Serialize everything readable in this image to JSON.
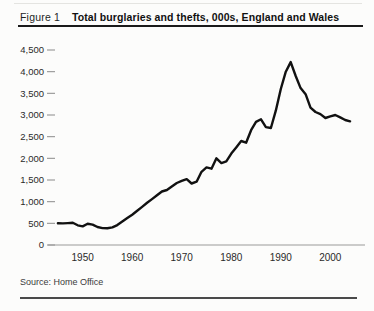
{
  "header": {
    "figure_label": "Figure 1",
    "title": "Total burglaries and thefts, 000s, England and Wales"
  },
  "footer": {
    "source": "Source: Home Office"
  },
  "chart_data": {
    "type": "line",
    "title": "Total burglaries and thefts, 000s, England and Wales",
    "series_name": "Total burglaries and thefts (000s)",
    "xlabel": "",
    "ylabel": "",
    "xlim": [
      1943,
      2007
    ],
    "ylim": [
      0,
      4500
    ],
    "grid": false,
    "legend": "none",
    "x_ticks": [
      1950,
      1960,
      1970,
      1980,
      1990,
      2000
    ],
    "y_ticks": [
      0,
      500,
      1000,
      1500,
      2000,
      2500,
      3000,
      3500,
      4000,
      4500
    ],
    "y_tick_labels": [
      "0",
      "500",
      "1,000",
      "1,500",
      "2,000",
      "2,500",
      "3,000",
      "3,500",
      "4,000",
      "4,500"
    ],
    "line_color": "#111111",
    "axis_color": "#9a9a9a",
    "tick_color": "#8a8a8a",
    "label_color": "#2a2a2a",
    "x": [
      1945,
      1946,
      1947,
      1948,
      1949,
      1950,
      1951,
      1952,
      1953,
      1954,
      1955,
      1956,
      1957,
      1958,
      1959,
      1960,
      1961,
      1962,
      1963,
      1964,
      1965,
      1966,
      1967,
      1968,
      1969,
      1970,
      1971,
      1972,
      1973,
      1974,
      1975,
      1976,
      1977,
      1978,
      1979,
      1980,
      1981,
      1982,
      1983,
      1984,
      1985,
      1986,
      1987,
      1988,
      1989,
      1990,
      1991,
      1992,
      1993,
      1994,
      1995,
      1996,
      1997,
      1998,
      1999,
      2000,
      2001,
      2002,
      2003,
      2004
    ],
    "values": [
      500,
      498,
      505,
      515,
      455,
      430,
      490,
      470,
      415,
      390,
      385,
      405,
      460,
      540,
      620,
      700,
      790,
      880,
      975,
      1060,
      1150,
      1235,
      1270,
      1350,
      1430,
      1480,
      1520,
      1420,
      1460,
      1690,
      1790,
      1760,
      2000,
      1890,
      1930,
      2110,
      2250,
      2400,
      2360,
      2650,
      2840,
      2900,
      2720,
      2700,
      3100,
      3600,
      4000,
      4220,
      3900,
      3620,
      3480,
      3170,
      3070,
      3020,
      2930,
      2970,
      3000,
      2945,
      2885,
      2855
    ]
  }
}
